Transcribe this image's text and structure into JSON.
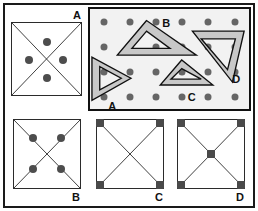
{
  "figure": {
    "width": 258,
    "height": 211,
    "background": "#ffffff",
    "frame_color": "#1a1a1a",
    "ink_color": "#2b2b2b",
    "dot_color": "#666666",
    "mark_color": "#4d4d4d",
    "band_fill": "#c8c8c8",
    "panel_fill": "#f2f2f2"
  },
  "panels": {
    "answer_square": {
      "label": "A",
      "label_position": "top-right-outside",
      "description": "square with two full diagonals forming an X and four round marks arranged in a diamond around the centre",
      "marks": [
        {
          "name": "top-mark",
          "x": 50,
          "y": 26
        },
        {
          "name": "left-mark",
          "x": 25,
          "y": 51
        },
        {
          "name": "right-mark",
          "x": 74,
          "y": 51
        },
        {
          "name": "bottom-mark",
          "x": 50,
          "y": 76
        }
      ]
    },
    "stimulus": {
      "label": "",
      "description": "grey panel with a regular grid of dots carrying four hollow set-square triangles labelled A, B, C and D",
      "grid": {
        "columns": 6,
        "rows": 4
      },
      "triangles": [
        {
          "id": "A",
          "label": "A",
          "label_x": 38,
          "label_y": 93,
          "orientation": "right-pointing right triangle, vertical left edge",
          "points": "6,50 6,93 44,72",
          "inner": "13,60 13,84 35,72"
        },
        {
          "id": "B",
          "label": "B",
          "label_x": 78,
          "label_y": 15,
          "orientation": "upward pointing isosceles triangle",
          "points": "58,12 28,48 109,48",
          "inner": "58,23 43,41 82,41"
        },
        {
          "id": "C",
          "label": "C",
          "label_x": 107,
          "label_y": 85,
          "orientation": "small upward pointing isosceles triangle",
          "points": "94,53 72,79 126,79",
          "inner": "94,62 83,73 114,73"
        },
        {
          "id": "D",
          "label": "D",
          "label_x": 146,
          "label_y": 71,
          "orientation": "right triangle with the right angle at the top right, hypotenuse from upper-left to lower-right",
          "points": "105,23 158,23 146,76",
          "inner": "114,31 149,31 141,63"
        }
      ],
      "dot_grid_note": "6 evenly spaced columns by 4 evenly spaced rows of round dots behind the triangles"
    },
    "option_b": {
      "label": "B",
      "label_position": "bottom-right-outside",
      "description": "square with two full diagonals forming an X and four round marks sitting on the diagonals between the centre and the corners",
      "marks": [
        {
          "name": "upper-left-mark",
          "x": 29,
          "y": 27
        },
        {
          "name": "upper-right-mark",
          "x": 71,
          "y": 27
        },
        {
          "name": "lower-left-mark",
          "x": 29,
          "y": 72
        },
        {
          "name": "lower-right-mark",
          "x": 71,
          "y": 72
        }
      ]
    },
    "option_c": {
      "label": "C",
      "label_position": "bottom-right-outside",
      "description": "square with two full diagonals forming an X and square marks at the four corners",
      "marks": [
        {
          "name": "top-left-corner-mark",
          "x": 5,
          "y": 5
        },
        {
          "name": "top-right-corner-mark",
          "x": 95,
          "y": 5
        },
        {
          "name": "bottom-left-corner-mark",
          "x": 5,
          "y": 95
        },
        {
          "name": "bottom-right-corner-mark",
          "x": 95,
          "y": 95
        }
      ]
    },
    "option_d": {
      "label": "D",
      "label_position": "bottom-right-outside",
      "description": "square with two full diagonals forming an X, square marks at the four corners plus one mark at the centre where the diagonals cross",
      "marks": [
        {
          "name": "top-left-corner-mark",
          "x": 5,
          "y": 5
        },
        {
          "name": "top-right-corner-mark",
          "x": 95,
          "y": 5
        },
        {
          "name": "bottom-left-corner-mark",
          "x": 5,
          "y": 95
        },
        {
          "name": "bottom-right-corner-mark",
          "x": 95,
          "y": 95
        },
        {
          "name": "centre-mark",
          "x": 50,
          "y": 50
        }
      ]
    }
  },
  "labels": {
    "a": "A",
    "b": "B",
    "c": "C",
    "d": "D"
  }
}
